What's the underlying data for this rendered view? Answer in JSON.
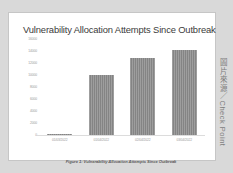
{
  "figure": {
    "caption": "Figure 1: Vulnerability Allocation Attempts Since Outbreak",
    "watermark_cjk": "圖片來源／",
    "watermark_latin": "Check Point",
    "panel_background": "#ffffff",
    "page_background": "#d9d9d9",
    "border_color": "#c6c6c6"
  },
  "chart_data": {
    "type": "bar",
    "title": "Vulnerability Allocation Attempts Since Outbreak",
    "xlabel": "",
    "ylabel": "",
    "categories": [
      "01/03/2022",
      "01/04/2022",
      "02/04/2022",
      "03/04/2022"
    ],
    "values": [
      250,
      10000,
      12800,
      14100
    ],
    "ylim": [
      0,
      16000
    ],
    "yticks": [
      16000,
      14000,
      12000,
      10000,
      8000,
      6000,
      4000,
      2000,
      0
    ],
    "ytick_labels": [
      "16000",
      "14000",
      "12000",
      "10000",
      "8000",
      "6000",
      "4000",
      "2000",
      "0"
    ],
    "grid": false,
    "legend": "none",
    "bar_color": "#8b8b8b",
    "series": [
      {
        "name": "Vulnerability Allocation Attempts",
        "values": [
          250,
          10000,
          12800,
          14100
        ]
      }
    ]
  }
}
